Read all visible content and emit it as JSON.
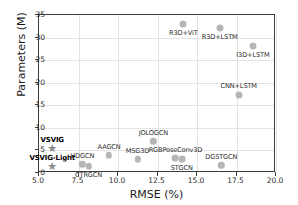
{
  "chart_data": {
    "type": "scatter",
    "title": "",
    "xlabel": "RMSE (%)",
    "ylabel": "Parameters (M)",
    "xlim": [
      5.0,
      20.0
    ],
    "ylim": [
      0,
      35
    ],
    "xticks": [
      "5.0",
      "7.5",
      "10.0",
      "12.5",
      "15.0",
      "17.5",
      "20.0"
    ],
    "xtick_values": [
      5.0,
      7.5,
      10.0,
      12.5,
      15.0,
      17.5,
      20.0
    ],
    "yticks": [
      "0",
      "5",
      "10",
      "15",
      "20",
      "25",
      "30",
      "35"
    ],
    "ytick_values": [
      0,
      5,
      10,
      15,
      20,
      25,
      30,
      35
    ],
    "grid": true,
    "legend": "none",
    "marker_color": "#b6b6b6",
    "highlight_marker": "star",
    "highlight_color": "#8a8a8a",
    "points": [
      {
        "label": "R3D+ViT",
        "x": 14.2,
        "y": 32.7,
        "marker": "circle",
        "size": 7.0,
        "label_pos": "below",
        "bold": false
      },
      {
        "label": "R3D+LSTM",
        "x": 16.5,
        "y": 32.0,
        "marker": "circle",
        "size": 7.0,
        "label_pos": "below",
        "bold": false
      },
      {
        "label": "I3D+LSTM",
        "x": 18.6,
        "y": 28.0,
        "marker": "circle",
        "size": 7.0,
        "label_pos": "below",
        "bold": false
      },
      {
        "label": "CNN+LSTM",
        "x": 17.7,
        "y": 17.1,
        "marker": "circle",
        "size": 7.0,
        "label_pos": "above",
        "bold": false
      },
      {
        "label": "JOLOGCN",
        "x": 12.3,
        "y": 6.8,
        "marker": "circle",
        "size": 6.4,
        "label_pos": "above",
        "bold": false
      },
      {
        "label": "AAGCN",
        "x": 9.5,
        "y": 3.7,
        "marker": "circle",
        "size": 6.4,
        "label_pos": "above",
        "bold": false
      },
      {
        "label": "MSG3D",
        "x": 11.3,
        "y": 2.8,
        "marker": "circle",
        "size": 6.4,
        "label_pos": "above",
        "bold": false
      },
      {
        "label": "RGBPoseConv3D",
        "x": 13.7,
        "y": 3.1,
        "marker": "circle",
        "size": 6.8,
        "label_pos": "above",
        "bold": false
      },
      {
        "label": "STGCN",
        "x": 14.1,
        "y": 2.9,
        "marker": "circle",
        "size": 6.8,
        "label_pos": "below",
        "bold": false
      },
      {
        "label": "HDGCN",
        "x": 7.8,
        "y": 1.7,
        "marker": "circle",
        "size": 6.4,
        "label_pos": "above",
        "bold": false
      },
      {
        "label": "CTRGCN",
        "x": 8.2,
        "y": 1.3,
        "marker": "circle",
        "size": 6.4,
        "label_pos": "below",
        "bold": false
      },
      {
        "label": "DGSTGCN",
        "x": 16.6,
        "y": 1.5,
        "marker": "circle",
        "size": 6.4,
        "label_pos": "above",
        "bold": false
      },
      {
        "label": "VSVIG",
        "x": 5.9,
        "y": 5.3,
        "marker": "star",
        "size": 7.0,
        "label_pos": "above",
        "bold": true
      },
      {
        "label": "VSVIG-Light",
        "x": 5.9,
        "y": 1.3,
        "marker": "star",
        "size": 7.0,
        "label_pos": "above",
        "bold": true
      }
    ]
  }
}
